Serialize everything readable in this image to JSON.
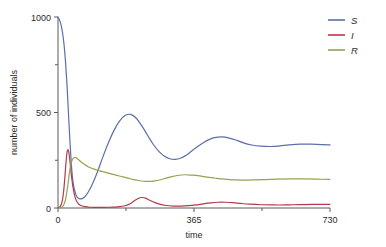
{
  "chart_data": {
    "type": "line",
    "title": "",
    "xlabel": "time",
    "ylabel": "number of individuals",
    "xlim": [
      0,
      730
    ],
    "ylim": [
      0,
      1000
    ],
    "xticks": [
      0,
      365,
      730
    ],
    "xtick_labels": [
      "0",
      "365",
      "730"
    ],
    "xminor_ticks": [
      182.5,
      547.5
    ],
    "yticks": [
      0,
      500,
      1000
    ],
    "ytick_labels": [
      "0",
      "500",
      "1000"
    ],
    "yminor_ticks": [
      250,
      750
    ],
    "grid": false,
    "legend_position": "top-right",
    "colors": {
      "S": "#5b6fa8",
      "I": "#b43a4a",
      "R": "#9aa050",
      "axis": "#5a5a5a",
      "text": "#2b2b2b",
      "background": "#ffffff"
    },
    "series": [
      {
        "name": "S",
        "label": "S",
        "color": "#5b6fa8",
        "x": [
          0,
          4,
          8,
          12,
          16,
          20,
          24,
          28,
          32,
          36,
          40,
          45,
          50,
          56,
          62,
          70,
          80,
          92,
          105,
          120,
          135,
          150,
          165,
          180,
          195,
          210,
          225,
          240,
          255,
          270,
          285,
          300,
          315,
          330,
          345,
          360,
          375,
          390,
          405,
          420,
          440,
          460,
          480,
          500,
          520,
          545,
          570,
          595,
          620,
          650,
          680,
          710,
          730
        ],
        "y": [
          1000,
          985,
          960,
          920,
          860,
          770,
          650,
          500,
          350,
          225,
          140,
          90,
          62,
          50,
          48,
          55,
          80,
          125,
          185,
          265,
          340,
          405,
          455,
          484,
          490,
          470,
          430,
          382,
          335,
          298,
          272,
          258,
          255,
          262,
          278,
          300,
          322,
          342,
          358,
          368,
          372,
          366,
          354,
          340,
          330,
          324,
          322,
          325,
          330,
          334,
          334,
          332,
          330
        ]
      },
      {
        "name": "I",
        "label": "I",
        "color": "#b43a4a",
        "x": [
          0,
          3,
          6,
          9,
          12,
          15,
          18,
          21,
          24,
          27,
          30,
          33,
          36,
          40,
          45,
          50,
          56,
          63,
          72,
          85,
          100,
          120,
          140,
          160,
          180,
          195,
          205,
          215,
          225,
          235,
          245,
          258,
          272,
          290,
          310,
          330,
          350,
          370,
          390,
          410,
          430,
          450,
          470,
          490,
          515,
          545,
          575,
          610,
          650,
          690,
          730
        ],
        "y": [
          2,
          4,
          9,
          20,
          42,
          85,
          150,
          228,
          288,
          305,
          280,
          228,
          170,
          112,
          62,
          35,
          20,
          12,
          7,
          4,
          3,
          3,
          4,
          6,
          12,
          24,
          38,
          50,
          55,
          52,
          42,
          30,
          20,
          13,
          10,
          10,
          12,
          16,
          22,
          27,
          30,
          30,
          28,
          24,
          20,
          17,
          16,
          16,
          18,
          19,
          19
        ]
      },
      {
        "name": "R",
        "label": "R",
        "color": "#9aa050",
        "x": [
          0,
          5,
          10,
          15,
          20,
          25,
          30,
          35,
          40,
          46,
          52,
          60,
          70,
          82,
          95,
          110,
          125,
          140,
          155,
          170,
          185,
          200,
          215,
          230,
          245,
          260,
          275,
          290,
          305,
          320,
          340,
          360,
          380,
          400,
          420,
          440,
          460,
          480,
          505,
          530,
          560,
          590,
          625,
          660,
          695,
          730
        ],
        "y": [
          0,
          1,
          4,
          14,
          42,
          100,
          175,
          232,
          258,
          265,
          258,
          245,
          230,
          215,
          205,
          196,
          188,
          180,
          172,
          165,
          158,
          150,
          144,
          140,
          139,
          142,
          148,
          156,
          164,
          170,
          174,
          172,
          168,
          162,
          157,
          152,
          149,
          147,
          146,
          147,
          149,
          151,
          152,
          152,
          151,
          150
        ]
      }
    ]
  },
  "legend": {
    "items": [
      {
        "label": "S",
        "color": "#5b6fa8"
      },
      {
        "label": "I",
        "color": "#b43a4a"
      },
      {
        "label": "R",
        "color": "#9aa050"
      }
    ]
  }
}
